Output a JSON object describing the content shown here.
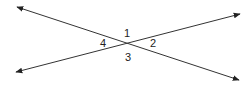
{
  "diagram": {
    "type": "intersecting-lines",
    "line_color": "#333333",
    "lines": [
      {
        "name": "line-a",
        "from": [
          17,
          7
        ],
        "to": [
          239,
          80
        ]
      },
      {
        "name": "line-b",
        "from": [
          16,
          72
        ],
        "to": [
          240,
          14
        ]
      }
    ],
    "intersection": [
      126,
      43
    ],
    "angles": [
      {
        "label": "1",
        "x": 127,
        "y": 33
      },
      {
        "label": "2",
        "x": 153,
        "y": 43
      },
      {
        "label": "3",
        "x": 128,
        "y": 57
      },
      {
        "label": "4",
        "x": 103,
        "y": 43
      }
    ]
  }
}
